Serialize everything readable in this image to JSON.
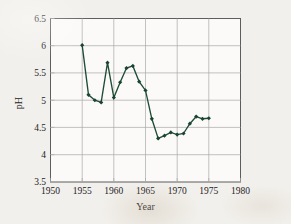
{
  "chart_data": {
    "type": "line",
    "title": "",
    "xlabel": "Year",
    "ylabel": "pH",
    "x": [
      1955,
      1956,
      1957,
      1958,
      1959,
      1960,
      1961,
      1962,
      1963,
      1964,
      1965,
      1966,
      1967,
      1968,
      1969,
      1970,
      1971,
      1972,
      1973,
      1974,
      1975
    ],
    "values": [
      6.01,
      5.1,
      5.0,
      4.96,
      5.69,
      5.05,
      5.33,
      5.59,
      5.63,
      5.34,
      5.18,
      4.66,
      4.3,
      4.35,
      4.41,
      4.37,
      4.39,
      4.57,
      4.7,
      4.66,
      4.67
    ],
    "series": [
      {
        "name": "pH",
        "values": [
          6.01,
          5.1,
          5.0,
          4.96,
          5.69,
          5.05,
          5.33,
          5.59,
          5.63,
          5.34,
          5.18,
          4.66,
          4.3,
          4.35,
          4.41,
          4.37,
          4.39,
          4.57,
          4.7,
          4.66,
          4.67
        ]
      }
    ],
    "xlim": [
      1950,
      1980
    ],
    "ylim": [
      3.5,
      6.5
    ],
    "xticks": [
      1950,
      1955,
      1960,
      1965,
      1970,
      1975,
      1980
    ],
    "yticks": [
      3.5,
      4,
      4.5,
      5,
      5.5,
      6,
      6.5
    ],
    "xtick_labels": [
      "1950",
      "1955",
      "1960",
      "1965",
      "1970",
      "1975",
      "1980"
    ],
    "ytick_labels": [
      "3.5",
      "4",
      "4.5",
      "5",
      "5.5",
      "6",
      "6.5"
    ],
    "grid": true,
    "legend": false,
    "legend_position": "none",
    "marker": "diamond",
    "line_color": "#1e4c36",
    "marker_color": "#1a4430",
    "grid_color": "#a9a9a9",
    "plot_background": "#fbfaf8",
    "figure_background": "#f2f0ec",
    "text_color": "#23201d",
    "annotations": []
  }
}
